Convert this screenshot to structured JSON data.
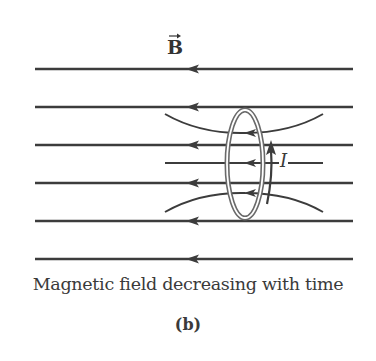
{
  "figure": {
    "field_label": "B",
    "field_label_vector": true,
    "current_label": "I",
    "caption": "Magnetic field decreasing with time",
    "sublabel": "(b)"
  },
  "colors": {
    "line": "#3c3c3c",
    "loop": "#6a6a6a",
    "text": "#3a3a3a",
    "background": "#ffffff"
  },
  "field_lines": {
    "direction": "right-to-left",
    "straight_y": [
      69,
      107,
      145,
      183,
      221,
      259
    ],
    "x_start": 35,
    "x_end": 353,
    "center_line_y": 163
  }
}
